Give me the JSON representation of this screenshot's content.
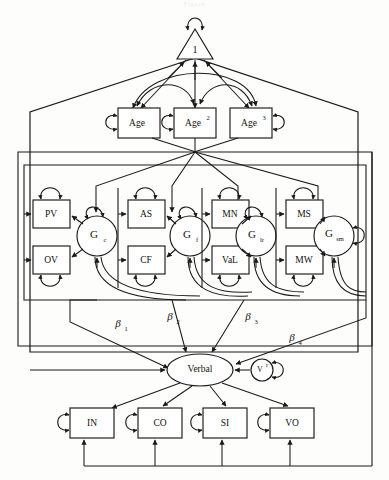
{
  "figure": {
    "title_fragment": "Figure",
    "type": "structural-equation-model-path-diagram"
  },
  "nodes": {
    "constant": {
      "label": "1",
      "shape": "triangle",
      "name": "unit-constant-node"
    },
    "age_terms": [
      {
        "label": "Age",
        "shape": "box",
        "name": "age-box"
      },
      {
        "label": "Age",
        "superscript": "2",
        "shape": "box",
        "name": "age-squared-box"
      },
      {
        "label": "Age",
        "superscript": "3",
        "shape": "box",
        "name": "age-cubed-box"
      }
    ],
    "factors": [
      {
        "label": "G",
        "subscript": "c",
        "shape": "circle",
        "name": "factor-gc",
        "indicators": [
          {
            "label": "PV",
            "name": "indicator-pv"
          },
          {
            "label": "OV",
            "name": "indicator-ov"
          }
        ]
      },
      {
        "label": "G",
        "subscript": "f",
        "shape": "circle",
        "name": "factor-gf",
        "indicators": [
          {
            "label": "AS",
            "name": "indicator-as"
          },
          {
            "label": "CF",
            "name": "indicator-cf"
          }
        ]
      },
      {
        "label": "G",
        "subscript": "lr",
        "shape": "circle",
        "name": "factor-glr",
        "indicators": [
          {
            "label": "MN",
            "name": "indicator-mn"
          },
          {
            "label": "VaL",
            "name": "indicator-val"
          }
        ]
      },
      {
        "label": "G",
        "subscript": "sm",
        "shape": "circle",
        "name": "factor-gsm",
        "indicators": [
          {
            "label": "MS",
            "name": "indicator-ms"
          },
          {
            "label": "MW",
            "name": "indicator-mw"
          }
        ]
      }
    ],
    "outcome": {
      "label": "Verbal",
      "shape": "ellipse",
      "name": "verbal-factor"
    },
    "residual": {
      "label": "V",
      "superscript": "r",
      "shape": "circle",
      "name": "verbal-residual"
    },
    "verbal_indicators": [
      {
        "label": "IN",
        "name": "indicator-in"
      },
      {
        "label": "CO",
        "name": "indicator-co"
      },
      {
        "label": "SI",
        "name": "indicator-si"
      },
      {
        "label": "VO",
        "name": "indicator-vo"
      }
    ]
  },
  "path_labels": [
    {
      "symbol": "β",
      "subscript": "1",
      "name": "beta-1-label",
      "from": "factor-gc",
      "to": "verbal-factor"
    },
    {
      "symbol": "β",
      "subscript": "2",
      "name": "beta-2-label",
      "from": "factor-gf",
      "to": "verbal-factor"
    },
    {
      "symbol": "β",
      "subscript": "3",
      "name": "beta-3-label",
      "from": "factor-glr",
      "to": "verbal-factor"
    },
    {
      "symbol": "β",
      "subscript": "4",
      "name": "beta-4-label",
      "from": "factor-gsm",
      "to": "verbal-factor"
    }
  ],
  "colors": {
    "stroke": "#1a1a1a",
    "fill": "#ffffff",
    "background": "#fdfdfc"
  }
}
